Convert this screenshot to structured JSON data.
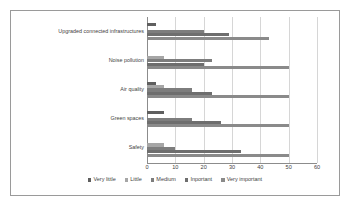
{
  "chart_data": {
    "type": "bar",
    "orientation": "horizontal",
    "title": "",
    "xlabel": "",
    "ylabel": "",
    "xlim": [
      0,
      60
    ],
    "xticks": [
      0,
      10,
      20,
      30,
      40,
      50,
      60
    ],
    "grid": true,
    "legend_position": "bottom",
    "categories": [
      "Upgraded connected infrastructures",
      "Noise pollution",
      "Air quality",
      "Green spaces",
      "Safety"
    ],
    "series": [
      {
        "name": "Very little",
        "color": "#5f5f5f",
        "values": [
          3,
          0,
          3,
          6,
          0
        ]
      },
      {
        "name": "Little",
        "color": "#a6a6a6",
        "values": [
          0,
          6,
          6,
          0,
          6
        ]
      },
      {
        "name": "Medium",
        "color": "#7d7d7d",
        "values": [
          20,
          23,
          16,
          16,
          10
        ]
      },
      {
        "name": "Inportant",
        "color": "#6e6e6e",
        "values": [
          29,
          20,
          23,
          26,
          33
        ]
      },
      {
        "name": "Very important",
        "color": "#8a8a8a",
        "values": [
          43,
          50,
          50,
          50,
          50
        ]
      }
    ]
  },
  "legend": {
    "items": [
      {
        "label": "Very little",
        "color": "#5f5f5f"
      },
      {
        "label": "Little",
        "color": "#a6a6a6"
      },
      {
        "label": "Medium",
        "color": "#7d7d7d"
      },
      {
        "label": "Inportant",
        "color": "#6e6e6e"
      },
      {
        "label": "Very important",
        "color": "#8a8a8a"
      }
    ]
  },
  "axis": {
    "x_tick_labels": [
      "0",
      "10",
      "20",
      "30",
      "40",
      "50",
      "60"
    ]
  }
}
